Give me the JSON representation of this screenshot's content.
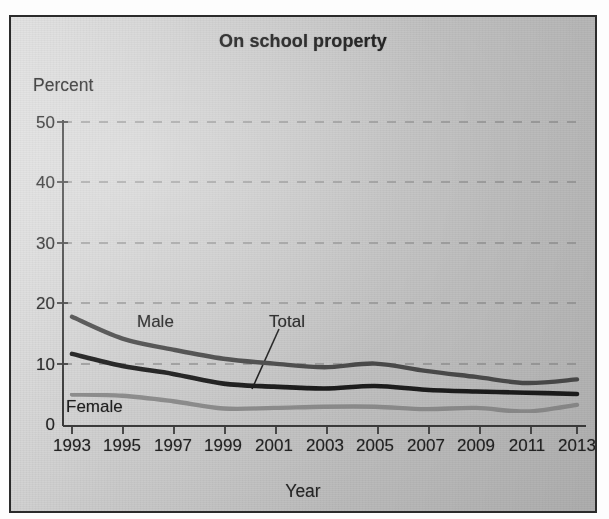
{
  "chart_data": {
    "type": "line",
    "title": "On school property",
    "subtitle": "",
    "xlabel": "Year",
    "ylabel": "Percent",
    "x": [
      1993,
      1995,
      1997,
      1999,
      2001,
      2003,
      2005,
      2007,
      2009,
      2011,
      2013
    ],
    "xtick_labels": [
      "1993",
      "1995",
      "1997",
      "1999",
      "2001",
      "2003",
      "2005",
      "2007",
      "2009",
      "2011",
      "2013"
    ],
    "ytick_labels": [
      "0",
      "10",
      "20",
      "30",
      "40",
      "50"
    ],
    "ytick_values": [
      0,
      10,
      20,
      30,
      40,
      50
    ],
    "xlim": [
      1993,
      2013
    ],
    "ylim": [
      0,
      50
    ],
    "grid": "horizontal-dashed",
    "legend": "inline-labels",
    "series": [
      {
        "name": "Male",
        "label": "Male",
        "color": "#4a4a4a",
        "values": [
          17.9,
          14.3,
          12.5,
          11.0,
          10.2,
          9.6,
          10.2,
          9.0,
          8.0,
          7.0,
          7.6
        ]
      },
      {
        "name": "Total",
        "label": "Total",
        "color": "#1c1c1c",
        "values": [
          11.8,
          9.8,
          8.5,
          6.9,
          6.4,
          6.1,
          6.5,
          5.9,
          5.6,
          5.4,
          5.2
        ]
      },
      {
        "name": "Female",
        "label": "Female",
        "color": "#8a8a8a",
        "values": [
          5.1,
          4.9,
          4.0,
          2.8,
          2.9,
          3.1,
          3.1,
          2.7,
          2.9,
          2.3,
          3.4
        ]
      }
    ],
    "annotations": [
      {
        "text": "Male",
        "x": 1996.8,
        "y": 15.2
      },
      {
        "text": "Total",
        "x": 2003.6,
        "y": 15.0
      },
      {
        "text": "Female",
        "x": 1993.4,
        "y": 2.6
      }
    ],
    "colors": {
      "panel_background": "#c9c9c9",
      "panel_border": "#2b2b2b",
      "axis": "#3a3a3a",
      "gridline": "#9a9a9a",
      "text": "#232323"
    }
  }
}
